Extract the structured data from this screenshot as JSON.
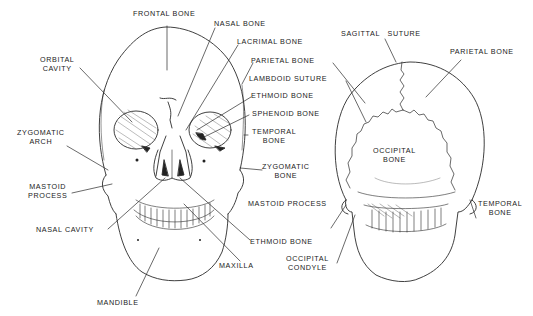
{
  "diagram": {
    "type": "anatomical-illustration",
    "stroke_color": "#2a2a2a",
    "background": "#ffffff"
  },
  "anterior_view": {
    "labels": {
      "frontal_bone": "FRONTAL BONE",
      "nasal_bone": "NASAL BONE",
      "lacrimal_bone": "LACRIMAL BONE",
      "orbital_cavity_1": "ORBITAL",
      "orbital_cavity_2": "CAVITY",
      "zygomatic_arch_1": "ZYGOMATIC",
      "zygomatic_arch_2": "ARCH",
      "mastoid_process_1": "MASTOID",
      "mastoid_process_2": "PROCESS",
      "nasal_cavity": "NASAL CAVITY",
      "mandible": "MANDIBLE",
      "maxilla": "MAXILLA",
      "ethmoid_bone": "ETHMOID BONE",
      "zygomatic_bone_1": "ZYGOMATIC",
      "zygomatic_bone_2": "BONE",
      "temporal_bone_1": "TEMPORAL",
      "temporal_bone_2": "BONE",
      "sphenoid_bone": "SPHENOID BONE",
      "ethmoid_bone_upper": "ETHMOID BONE",
      "lambdoid_suture": "LAMBDOID SUTURE",
      "parietal_bone": "PARIETAL BONE"
    }
  },
  "posterior_view": {
    "labels": {
      "sagittal_suture": "SAGITTAL   SUTURE",
      "parietal_bone": "PARIETAL BONE",
      "occipital_bone_1": "OCCIPITAL",
      "occipital_bone_2": "BONE",
      "temporal_bone_1": "TEMPORAL",
      "temporal_bone_2": "BONE",
      "mastoid_process": "MASTOID PROCESS",
      "occipital_condyle_1": "OCCIPITAL",
      "occipital_condyle_2": "CONDYLE"
    }
  }
}
